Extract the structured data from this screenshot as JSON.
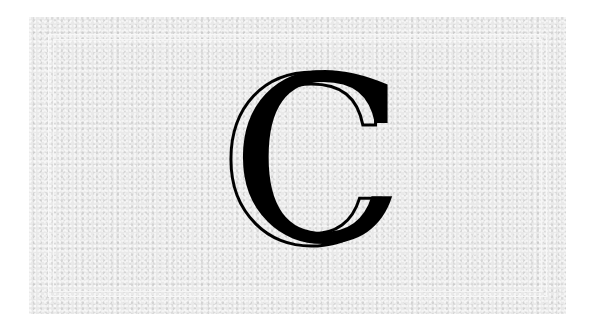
{
  "card": {
    "letter": "C",
    "colors": {
      "paper": "#e9e9e9",
      "frame": "#f8f8f8",
      "ink": "#000000"
    }
  }
}
